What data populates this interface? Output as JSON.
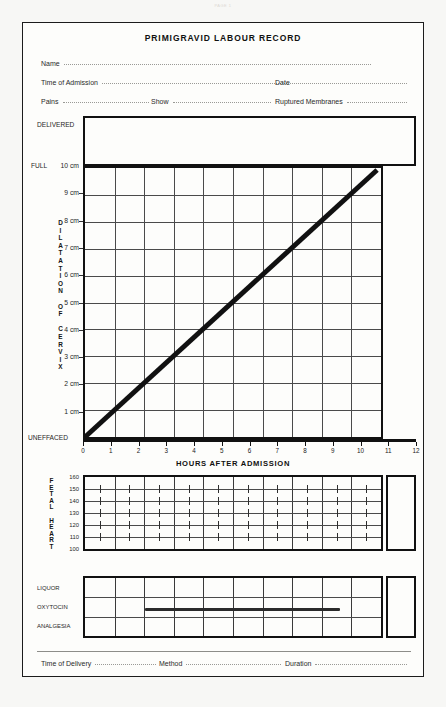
{
  "page_mark": "PAGE 1",
  "form": {
    "title": "PRIMIGRAVID LABOUR RECORD",
    "fields": {
      "name": "Name",
      "time_of_admission": "Time of Admission",
      "date": "Date",
      "pains": "Pains",
      "show": "Show",
      "ruptured_membranes": "Ruptured Membranes",
      "time_of_delivery": "Time of Delivery",
      "method": "Method",
      "duration": "Duration"
    }
  },
  "partogram": {
    "delivered_label": "DELIVERED",
    "full_label": "FULL",
    "uneffaced_label": "UNEFFACED",
    "y_axis_caption": "DILATATION OF CERVIX",
    "y_axis_caption_letters": [
      "D",
      "I",
      "L",
      "A",
      "T",
      "A",
      "T",
      "I",
      "O",
      "N",
      " ",
      "O",
      "F",
      " ",
      "C",
      "E",
      "R",
      "V",
      "I",
      "X"
    ],
    "y_ticks": [
      "10 cm",
      "9 cm",
      "8 cm",
      "7 cm",
      "6 cm",
      "5 cm",
      "4 cm",
      "3 cm",
      "2 cm",
      "1 cm"
    ],
    "x_title": "HOURS AFTER ADMISSION",
    "x_ticks": [
      "0",
      "1",
      "2",
      "3",
      "4",
      "5",
      "6",
      "7",
      "8",
      "9",
      "10",
      "11",
      "12"
    ]
  },
  "fetal_heart": {
    "caption": "FETAL HEART",
    "caption_letters": [
      "F",
      "E",
      "T",
      "A",
      "L",
      " ",
      "H",
      "E",
      "A",
      "R",
      "T"
    ],
    "y_ticks": [
      "160",
      "150",
      "140",
      "130",
      "120",
      "110",
      "100"
    ]
  },
  "observations": {
    "rows": [
      "LIQUOR",
      "OXYTOCIN",
      "ANALGESIA"
    ]
  },
  "chart_data": {
    "type": "line",
    "title": "PRIMIGRAVID LABOUR RECORD",
    "charts": [
      {
        "name": "cervical-dilatation-partogram",
        "type": "line",
        "xlabel": "HOURS AFTER ADMISSION",
        "ylabel": "DILATATION OF CERVIX",
        "xlim": [
          0,
          12
        ],
        "ylim": [
          0,
          10
        ],
        "ytick_labels": [
          "UNEFFACED",
          "1 cm",
          "2 cm",
          "3 cm",
          "4 cm",
          "5 cm",
          "6 cm",
          "7 cm",
          "8 cm",
          "9 cm",
          "10 cm"
        ],
        "ytick_values": [
          0,
          1,
          2,
          3,
          4,
          5,
          6,
          7,
          8,
          9,
          10
        ],
        "xtick_values": [
          0,
          1,
          2,
          3,
          4,
          5,
          6,
          7,
          8,
          9,
          10,
          11,
          12
        ],
        "grid": true,
        "grid_x_range": [
          0,
          10
        ],
        "series": [
          {
            "name": "alert-line",
            "x": [
              0,
              10
            ],
            "y": [
              0,
              10
            ],
            "style": "thick-solid",
            "color": "#111111"
          }
        ]
      },
      {
        "name": "fetal-heart-rate",
        "type": "line",
        "ylabel": "FETAL HEART",
        "ylim": [
          100,
          160
        ],
        "ytick_values": [
          100,
          110,
          120,
          130,
          140,
          150,
          160
        ],
        "ytick_labels": [
          "100",
          "110",
          "120",
          "130",
          "140",
          "150",
          "160"
        ],
        "xlim": [
          0,
          10
        ],
        "grid": true,
        "series": []
      },
      {
        "name": "labour-observations",
        "type": "table",
        "categories": [
          "LIQUOR",
          "OXYTOCIN",
          "ANALGESIA"
        ],
        "xlim": [
          0,
          10
        ],
        "annotations": [
          {
            "row": "OXYTOCIN",
            "x_start": 2.0,
            "x_end": 8.5,
            "style": "thick-bar",
            "color": "#2b2b2b"
          }
        ]
      }
    ]
  }
}
